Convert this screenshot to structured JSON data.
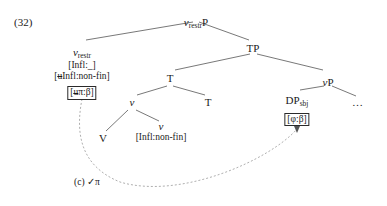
{
  "figure": {
    "example_number": "(32)",
    "type": "syntax-tree"
  },
  "nodes": {
    "root": {
      "label": "v",
      "subscript": "restr",
      "suffix": "P",
      "x": 196,
      "y": 12
    },
    "v_restr_head": {
      "label": "v",
      "subscript": "restr",
      "x": 82,
      "y": 44,
      "features": [
        "[Infl:_]",
        "[uInfl:non-fin]"
      ],
      "boxed_feature": "[uπ:β]"
    },
    "tp": {
      "label": "TP",
      "x": 253,
      "y": 44
    },
    "t_bar": {
      "label": "T",
      "x": 170,
      "y": 76
    },
    "t_head": {
      "label": "T",
      "x": 208,
      "y": 100
    },
    "v_bar": {
      "label": "v",
      "subscript": "",
      "x": 132,
      "y": 100
    },
    "v_head_upper": {
      "label": "v",
      "x": 103,
      "y": 137
    },
    "vp": {
      "label": "vP",
      "x": 328,
      "y": 76
    },
    "v_head_lower": {
      "label": "v",
      "x": 161,
      "y": 126
    },
    "v_head_lower_feature": "[Infl:non-fin]",
    "dp_sbj": {
      "label": "DP",
      "subscript": "sbj",
      "x": 297,
      "y": 94,
      "boxed_feature": "[φ:β]"
    },
    "ellipsis": {
      "label": "…",
      "x": 358,
      "y": 101
    }
  },
  "annotations": {
    "agree_label": "(c)",
    "agree_check": "✓π",
    "agree_x": 74,
    "agree_y": 176
  },
  "colors": {
    "ink": "#1a1a1a",
    "line": "#555555",
    "dashed": "#8a8a8a",
    "background": "#ffffff"
  }
}
